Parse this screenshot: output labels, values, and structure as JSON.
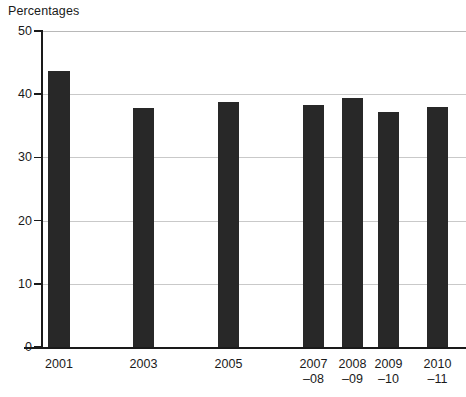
{
  "chart_data": {
    "type": "bar",
    "title": "",
    "ylabel": "Percentages",
    "xlabel": "",
    "ylim": [
      0,
      50
    ],
    "yticks": [
      0,
      10,
      20,
      30,
      40,
      50
    ],
    "ytick_labels": [
      "0",
      "10",
      "20",
      "30",
      "40",
      "50"
    ],
    "grid": true,
    "legend": "none",
    "bar_color": "#282828",
    "gridline_color": "#c9c9c9",
    "axis_color": "#1a1a1a",
    "categories": [
      "2001",
      "2003",
      "2005",
      "2007–08",
      "2008–09",
      "2009–10",
      "2010–11"
    ],
    "category_lines": [
      [
        "2001",
        ""
      ],
      [
        "2003",
        ""
      ],
      [
        "2005",
        ""
      ],
      [
        "2007",
        "–08"
      ],
      [
        "2008",
        "–09"
      ],
      [
        "2009",
        "–10"
      ],
      [
        "2010",
        "–11"
      ]
    ],
    "values": [
      43.7,
      37.8,
      38.8,
      38.3,
      39.4,
      37.2,
      37.9
    ]
  },
  "axis": {
    "title": "Percentages"
  }
}
